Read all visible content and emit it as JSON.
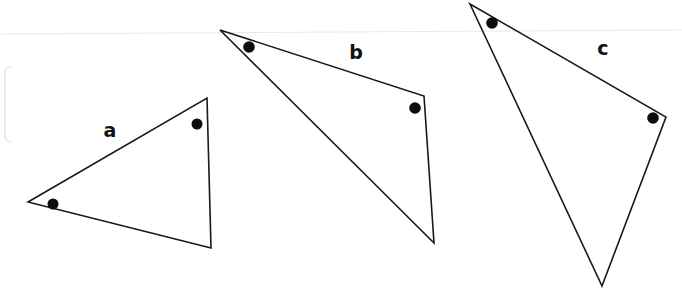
{
  "page": {
    "background_color": "#ffffff",
    "width": 682,
    "height": 296,
    "stroke_color": "#191919",
    "dot_color": "#0d0d0d",
    "scan_artifact_color": "#e9e9ee"
  },
  "figures": [
    {
      "id": "triangle-a",
      "label": "a",
      "label_position": {
        "x": 110,
        "y": 130
      },
      "vertices": [
        {
          "x": 28,
          "y": 202
        },
        {
          "x": 207,
          "y": 98
        },
        {
          "x": 211,
          "y": 248
        }
      ],
      "marked_angles": [
        {
          "x": 53,
          "y": 204,
          "r": 5.5
        },
        {
          "x": 197,
          "y": 124,
          "r": 5.5
        }
      ]
    },
    {
      "id": "triangle-b",
      "label": "b",
      "label_position": {
        "x": 356,
        "y": 52
      },
      "vertices": [
        {
          "x": 220,
          "y": 30
        },
        {
          "x": 424,
          "y": 96
        },
        {
          "x": 434,
          "y": 243
        }
      ],
      "marked_angles": [
        {
          "x": 249,
          "y": 47,
          "r": 5.8
        },
        {
          "x": 415,
          "y": 108,
          "r": 5.8
        }
      ]
    },
    {
      "id": "triangle-c",
      "label": "c",
      "label_position": {
        "x": 603,
        "y": 48
      },
      "vertices": [
        {
          "x": 470,
          "y": 4
        },
        {
          "x": 666,
          "y": 117
        },
        {
          "x": 602,
          "y": 286
        }
      ],
      "marked_angles": [
        {
          "x": 492,
          "y": 23,
          "r": 5.8
        },
        {
          "x": 653,
          "y": 118,
          "r": 5.8
        }
      ]
    }
  ],
  "scan_artifacts": {
    "horizontal_line": {
      "x1": 0,
      "y1": 34,
      "x2": 682,
      "y2": 30
    },
    "left_edge_line": {
      "x1": 5,
      "y1": 70,
      "x2": 5,
      "y2": 138
    },
    "left_edge_arc_top": "M 5 72 Q 5 68 11 67",
    "left_edge_arc_bottom": "M 5 136 Q 5 141 11 142"
  }
}
